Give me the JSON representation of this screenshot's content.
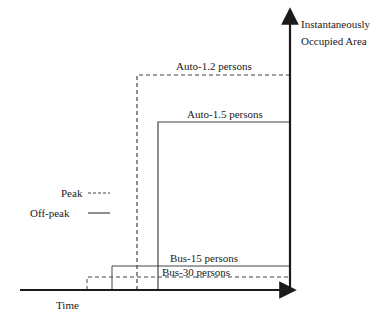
{
  "axes": {
    "y_label_line1": "Instantaneously",
    "y_label_line2": "Occupied Area",
    "x_label": "Time"
  },
  "legend": {
    "peak_label": "Peak",
    "offpeak_label": "Off-peak"
  },
  "series": [
    {
      "label": "Auto-1.2 persons",
      "style": "dashed",
      "condition": "Peak"
    },
    {
      "label": "Auto-1.5  persons",
      "style": "solid",
      "condition": "Off-peak"
    },
    {
      "label": "Bus-15 persons",
      "style": "solid",
      "condition": "Off-peak"
    },
    {
      "label": "Bus-30 persons",
      "style": "dashed",
      "condition": "Peak"
    }
  ],
  "colors": {
    "line": "#1a1a1a",
    "thin_line": "#555555",
    "background": "#ffffff"
  }
}
